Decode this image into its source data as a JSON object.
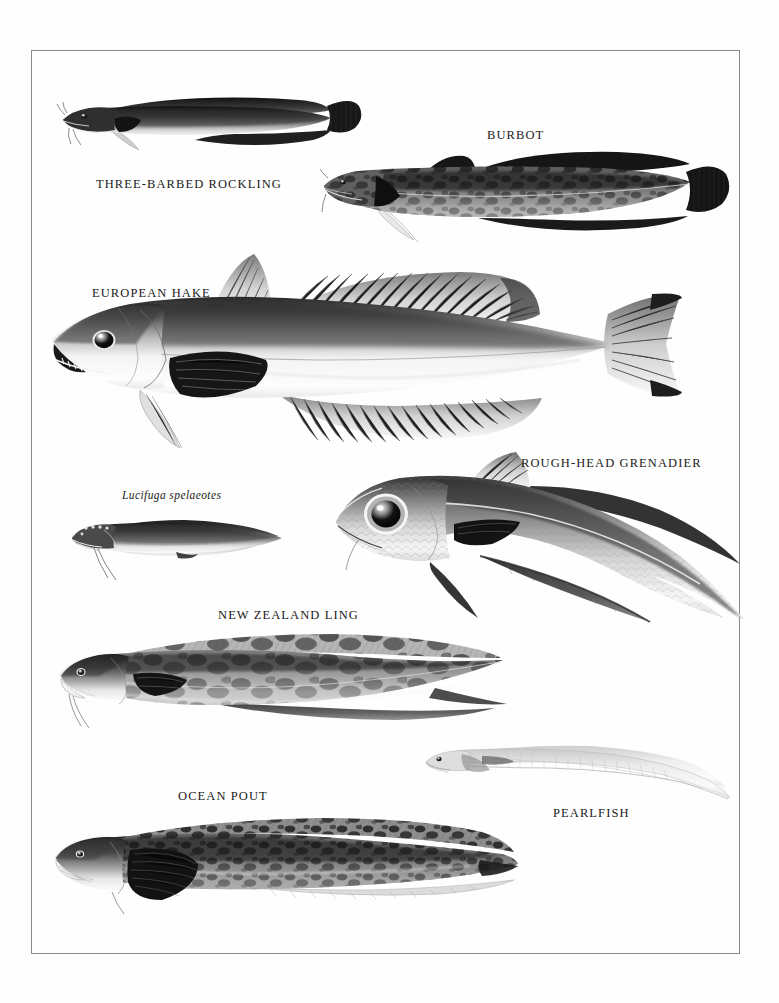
{
  "plate": {
    "kind": "natural-history illustration plate",
    "subject": "cod-like and eel-like fishes",
    "palette": {
      "page_background": "#ffffff",
      "frame_border": "#8a8a8a",
      "label_text": "#1a1a1a",
      "ink_dark": "#1c1c1c",
      "ink_mid": "#6e6e6e",
      "ink_light": "#cfcfcf"
    },
    "frame": {
      "x": 31,
      "y": 50,
      "width": 709,
      "height": 904
    }
  },
  "figures": [
    {
      "id": "three-barbed-rockling",
      "label": "THREE-BARBED ROCKLING",
      "label_style": "caps",
      "label_x": 96,
      "label_y": 177,
      "fish_x": 55,
      "fish_y": 84,
      "fish_w": 310,
      "fish_h": 72,
      "tone": "dark-back-pale-belly",
      "notes": "long dorsal and anal fin ribbons, rounded tail, chin barbels"
    },
    {
      "id": "burbot",
      "label": "BURBOT",
      "label_style": "caps",
      "label_x": 487,
      "label_y": 136,
      "fish_x": 318,
      "fish_y": 142,
      "fish_w": 420,
      "fish_h": 100,
      "tone": "mottled-dark",
      "notes": "two dorsal fins, heavy marbling, rounded caudal fin, single chin barbel"
    },
    {
      "id": "european-hake",
      "label": "EUROPEAN HAKE",
      "label_style": "caps",
      "label_x": 92,
      "label_y": 294,
      "fish_x": 40,
      "fish_y": 248,
      "fish_w": 660,
      "fish_h": 200,
      "tone": "silver-graded",
      "notes": "largest figure, big eye, toothed jaw, tall second dorsal, forked-square tail"
    },
    {
      "id": "rough-head-grenadier",
      "label": "ROUGH-HEAD GRENADIER",
      "label_style": "caps",
      "label_x": 521,
      "label_y": 464,
      "fish_x": 330,
      "fish_y": 452,
      "fish_w": 412,
      "fish_h": 175,
      "tone": "scaled-silver",
      "notes": "very large eye, scaly head ridges, body tapering into a long looping tail"
    },
    {
      "id": "lucifuga-spelaeotes",
      "label": "Lucifuga spelaeotes",
      "label_style": "italic",
      "label_x": 122,
      "label_y": 497,
      "fish_x": 64,
      "fish_y": 508,
      "fish_w": 230,
      "fish_h": 72,
      "tone": "uniform-grey",
      "notes": "small blind cave brotula, long trailing pelvic filaments"
    },
    {
      "id": "new-zealand-ling",
      "label": "NEW ZEALAND LING",
      "label_style": "caps",
      "label_x": 218,
      "label_y": 616,
      "fish_x": 55,
      "fish_y": 628,
      "fish_w": 450,
      "fish_h": 105,
      "tone": "blotched-grey",
      "notes": "elongate body, blotchy saddles, pointed tapering tail, chin barbel"
    },
    {
      "id": "pearlfish",
      "label": "PEARLFISH",
      "label_style": "caps",
      "label_x": 553,
      "label_y": 819,
      "fish_x": 420,
      "fish_y": 736,
      "fish_w": 310,
      "fish_h": 66,
      "tone": "translucent-pale",
      "notes": "very pale, translucent, whip-like tapering tail curving downward"
    },
    {
      "id": "ocean-pout",
      "label": "OCEAN POUT",
      "label_style": "caps",
      "label_x": 178,
      "label_y": 797,
      "fish_x": 50,
      "fish_y": 808,
      "fish_w": 465,
      "fish_h": 110,
      "tone": "mottled-dark",
      "notes": "eel-like, large rounded pectoral fin, marbled back, continuous fin fold"
    }
  ]
}
